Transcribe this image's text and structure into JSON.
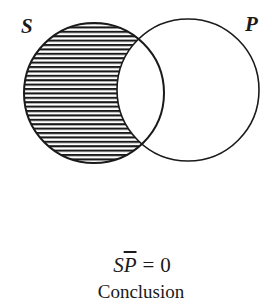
{
  "diagram": {
    "type": "venn",
    "sets": [
      {
        "id": "S",
        "label": "S",
        "cx": 94,
        "cy": 93,
        "r": 70
      },
      {
        "id": "P",
        "label": "P",
        "cx": 188,
        "cy": 90,
        "r": 71
      }
    ],
    "shaded_region": "S-not-P",
    "shading_style": "horizontal-hatching",
    "colors": {
      "stroke": "#1a1a1a",
      "background": "#ffffff"
    }
  },
  "labels": {
    "s": "S",
    "p": "P"
  },
  "formula": {
    "subject": "S",
    "negated_predicate": "P",
    "equals": "=",
    "value": "0"
  },
  "caption": "Conclusion"
}
